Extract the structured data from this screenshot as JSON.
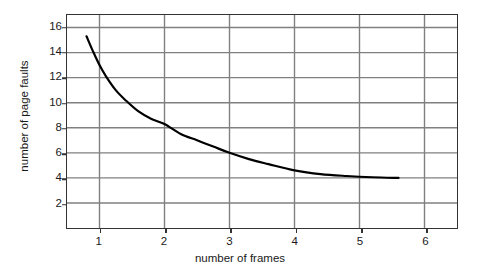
{
  "chart_data": {
    "type": "line",
    "title": "",
    "xlabel": "number of frames",
    "ylabel": "number of page faults",
    "xlim": [
      0.5,
      6.5
    ],
    "ylim": [
      0,
      17
    ],
    "xticks": [
      1,
      2,
      3,
      4,
      5,
      6
    ],
    "xtick_labels": [
      "1",
      "2",
      "3",
      "4",
      "5",
      "6"
    ],
    "yticks": [
      2,
      4,
      6,
      8,
      10,
      12,
      14,
      16
    ],
    "ytick_labels": [
      "2",
      "4",
      "6",
      "8",
      "10",
      "12",
      "14",
      "16"
    ],
    "grid": true,
    "grid_color": "#808080",
    "frame_color": "#333333",
    "line_color": "#000000",
    "line_width": 2.2,
    "legend": null,
    "series": [
      {
        "name": "page faults",
        "x": [
          0.8,
          0.9,
          1.0,
          1.1,
          1.25,
          1.4,
          1.6,
          1.8,
          2.0,
          2.25,
          2.5,
          2.75,
          3.0,
          3.3,
          3.6,
          4.0,
          4.4,
          4.8,
          5.2,
          5.6
        ],
        "y": [
          15.3,
          14.1,
          13.0,
          12.1,
          11.0,
          10.2,
          9.3,
          8.7,
          8.3,
          7.5,
          7.0,
          6.5,
          6.0,
          5.5,
          5.1,
          4.6,
          4.3,
          4.15,
          4.05,
          4.0
        ]
      }
    ]
  },
  "annotations": {
    "caption": ""
  }
}
